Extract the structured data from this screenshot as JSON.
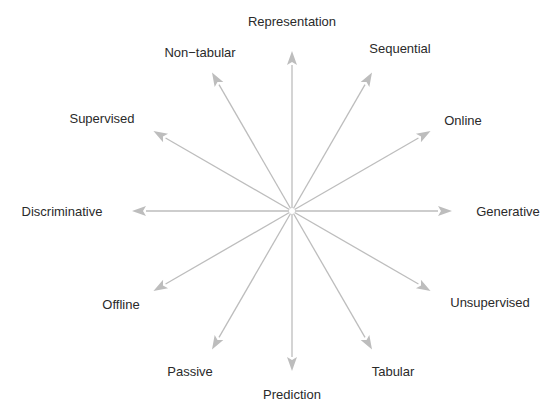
{
  "diagram": {
    "type": "radial-axes",
    "center": [
      292,
      211
    ],
    "radius": 160,
    "arrow_color": "#bdbdbd",
    "label_color": "#2a2a2a",
    "axes": [
      {
        "label": "Representation",
        "angle_deg": 90,
        "label_pos": [
          292,
          26
        ]
      },
      {
        "label": "Sequential",
        "angle_deg": 60,
        "label_pos": [
          400,
          53
        ]
      },
      {
        "label": "Online",
        "angle_deg": 30,
        "label_pos": [
          463,
          125
        ]
      },
      {
        "label": "Generative",
        "angle_deg": 0,
        "label_pos": [
          508,
          216
        ]
      },
      {
        "label": "Unsupervised",
        "angle_deg": -30,
        "label_pos": [
          490,
          307
        ]
      },
      {
        "label": "Tabular",
        "angle_deg": -60,
        "label_pos": [
          393,
          376
        ]
      },
      {
        "label": "Prediction",
        "angle_deg": -90,
        "label_pos": [
          292,
          399
        ]
      },
      {
        "label": "Passive",
        "angle_deg": -120,
        "label_pos": [
          190,
          376
        ]
      },
      {
        "label": "Offline",
        "angle_deg": -150,
        "label_pos": [
          121,
          309
        ]
      },
      {
        "label": "Discriminative",
        "angle_deg": 180,
        "label_pos": [
          62,
          216
        ]
      },
      {
        "label": "Supervised",
        "angle_deg": 150,
        "label_pos": [
          102,
          123
        ]
      },
      {
        "label": "Non−tabular",
        "angle_deg": 120,
        "label_pos": [
          200,
          57
        ]
      }
    ]
  }
}
